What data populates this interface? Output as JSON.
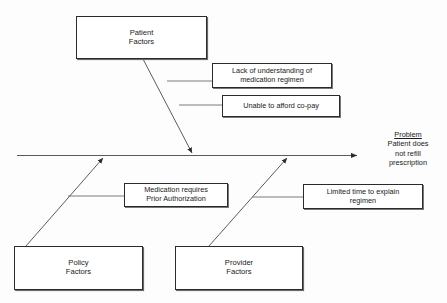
{
  "diagram": {
    "type": "fishbone-cause-and-effect",
    "problem": {
      "title": "Problem",
      "statement": "Patient does\nnot refill\nprescription"
    },
    "categories": [
      {
        "id": "patient",
        "label": "Patient\nFactors"
      },
      {
        "id": "policy",
        "label": "Policy\nFactors"
      },
      {
        "id": "provider",
        "label": "Provider\nFactors"
      }
    ],
    "causes": [
      {
        "id": "lack-understanding",
        "category": "patient",
        "label": "Lack of understanding of\nmedication regimen"
      },
      {
        "id": "afford-copay",
        "category": "patient",
        "label": "Unable to afford co-pay"
      },
      {
        "id": "prior-auth",
        "category": "policy",
        "label": "Medication requires\nPrior Authorization"
      },
      {
        "id": "limited-time",
        "category": "provider",
        "label": "Limited time to explain\nregimen"
      }
    ],
    "colors": {
      "background": "#fdfdfd",
      "line": "#3a3a3a",
      "box_border": "#2b2b2b",
      "text": "#1a1a1a"
    }
  }
}
